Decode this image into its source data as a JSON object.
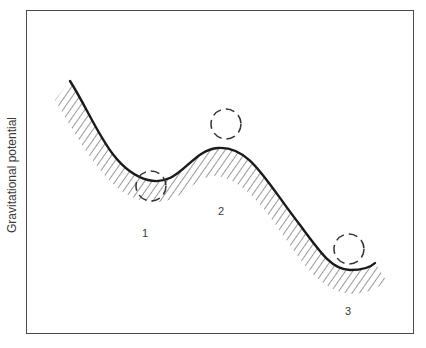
{
  "diagram": {
    "title": "",
    "y_axis_label": "Gravitational potential",
    "colors": {
      "frame": "#4a4a4a",
      "curve": "#1a1a1a",
      "hatch": "#444444",
      "ball_outline": "#333333",
      "text": "#3a3a3a"
    },
    "curve": {
      "description": "Potential energy landscape with a shallow well, a hill, and a deeper well",
      "stroke_width": 2.4
    },
    "balls": [
      {
        "id": "ball-1",
        "position": "resting in shallow well (metastable)",
        "cx": 151,
        "cy": 186,
        "r": 15
      },
      {
        "id": "ball-2",
        "position": "balanced on hilltop (unstable)",
        "cx": 226,
        "cy": 124,
        "r": 15
      },
      {
        "id": "ball-3",
        "position": "resting in deep well (stable)",
        "cx": 349,
        "cy": 249,
        "r": 15
      }
    ],
    "state_labels": [
      {
        "text": "1",
        "x": 145,
        "y": 233
      },
      {
        "text": "2",
        "x": 221,
        "y": 211
      },
      {
        "text": "3",
        "x": 348,
        "y": 311
      }
    ]
  }
}
